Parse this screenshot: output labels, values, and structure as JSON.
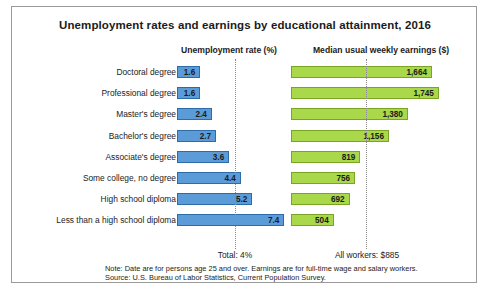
{
  "chart_data": {
    "type": "bar",
    "title": "Unemployment rates and earnings by educational attainment, 2016",
    "orientation": "horizontal",
    "grid": false,
    "legend_position": "none",
    "categories": [
      "Doctoral degree",
      "Professional degree",
      "Master's degree",
      "Bachelor's degree",
      "Associate's degree",
      "Some college, no degree",
      "High school diploma",
      "Less than a high school diploma"
    ],
    "series": [
      {
        "name": "Unemployment rate (%)",
        "unit": "%",
        "color": "#5b9bd8",
        "border_color": "#2d6ca8",
        "xlim": [
          0,
          7.4
        ],
        "values": [
          1.6,
          1.6,
          2.4,
          2.7,
          3.6,
          4.4,
          5.2,
          7.4
        ],
        "labels": [
          "1.6",
          "1.6",
          "2.4",
          "2.7",
          "3.6",
          "4.4",
          "5.2",
          "7.4"
        ],
        "reference_line": {
          "value": 4,
          "label": "Total: 4%",
          "style": "dotted"
        }
      },
      {
        "name": "Median usual weekly earnings ($)",
        "unit": "$",
        "color": "#a9d84a",
        "border_color": "#7ba427",
        "xlim": [
          0,
          1745
        ],
        "values": [
          1664,
          1745,
          1380,
          1156,
          819,
          756,
          692,
          504
        ],
        "labels": [
          "1,664",
          "1,745",
          "1,380",
          "1,156",
          "819",
          "756",
          "692",
          "504"
        ],
        "reference_line": {
          "value": 885,
          "label": "All workers: $885",
          "style": "dotted"
        }
      }
    ],
    "annotations": [
      "Note: Date are for persons age 25 and over. Earnings are for full-time wage and salary workers.",
      "Source: U.S. Bureau of Labor Statistics, Current Population Survey."
    ]
  },
  "headers": {
    "unemployment": "Unemployment rate (%)",
    "earnings": "Median usual weekly earnings ($)"
  },
  "totals": {
    "unemployment": "Total: 4%",
    "earnings": "All workers: $885"
  },
  "notes": {
    "note": "Note: Date are for persons age 25 and over. Earnings are for full-time wage and salary workers.",
    "source": "Source: U.S. Bureau of Labor Statistics, Current Population Survey."
  }
}
